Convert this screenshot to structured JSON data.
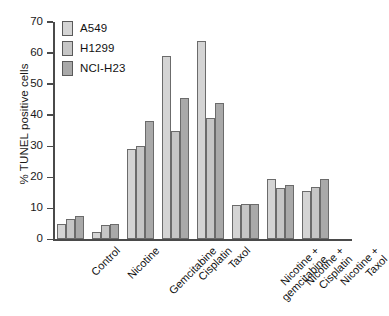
{
  "chart_data": {
    "type": "bar",
    "title": "",
    "xlabel": "",
    "ylabel": "% TUNEL positive cells",
    "ylim": [
      0,
      70
    ],
    "ytick_step": 10,
    "yticks": [
      0,
      10,
      20,
      30,
      40,
      50,
      60,
      70
    ],
    "grid": false,
    "legend_position": "top-left",
    "categories": [
      "Control",
      "Nicotine",
      "Gemcitabine",
      "Cisplatin",
      "Taxol",
      "Nicotine + gemcitabine",
      "Nicotine + Cisplatin",
      "Nicotine + Taxol"
    ],
    "series": [
      {
        "name": "A549",
        "color": "#d4d4d4",
        "values": [
          5.0,
          2.5,
          29.0,
          59.0,
          64.0,
          11.0,
          19.5,
          15.5
        ]
      },
      {
        "name": "H1299",
        "color": "#c6c6c6",
        "values": [
          6.5,
          4.5,
          30.0,
          35.0,
          39.0,
          11.5,
          16.5,
          17.0
        ]
      },
      {
        "name": "NCI-H23",
        "color": "#a9a9a9",
        "values": [
          7.5,
          5.0,
          38.0,
          45.5,
          44.0,
          11.5,
          17.5,
          19.5
        ]
      }
    ]
  },
  "legend": {
    "items": [
      {
        "label": "A549"
      },
      {
        "label": "H1299"
      },
      {
        "label": "NCI-H23"
      }
    ]
  },
  "axis": {
    "y_title": "% TUNEL positive cells"
  }
}
